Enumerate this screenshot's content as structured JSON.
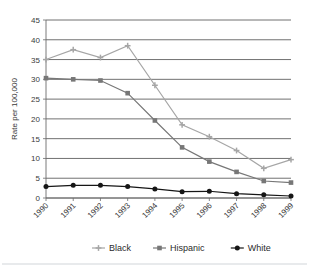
{
  "chart_data": {
    "type": "line",
    "title": "",
    "xlabel": "",
    "ylabel": "Rate per 100,000",
    "categories": [
      "1990",
      "1991",
      "1992",
      "1993",
      "1994",
      "1995",
      "1996",
      "1997",
      "1998",
      "1999"
    ],
    "ylim": [
      0,
      45
    ],
    "yticks": [
      0,
      5,
      10,
      15,
      20,
      25,
      30,
      35,
      40,
      45
    ],
    "grid": "horizontal",
    "legend_position": "bottom",
    "series": [
      {
        "name": "Black",
        "color": "#a6a6a6",
        "marker": "cross",
        "values": [
          35,
          37.5,
          35.5,
          38.5,
          28.5,
          18.5,
          15.5,
          12,
          7.5,
          9.7
        ]
      },
      {
        "name": "Hispanic",
        "color": "#777777",
        "marker": "square",
        "values": [
          30.3,
          30,
          29.7,
          26.5,
          19.6,
          12.8,
          9.2,
          6.6,
          4.3,
          3.9
        ]
      },
      {
        "name": "White",
        "color": "#161616",
        "marker": "circle",
        "values": [
          2.9,
          3.2,
          3.2,
          2.9,
          2.3,
          1.6,
          1.7,
          1.1,
          0.8,
          0.5
        ]
      }
    ]
  },
  "axis": {
    "y_title": "Rate per 100,000",
    "y_tick_labels": [
      "0",
      "5",
      "10",
      "15",
      "20",
      "25",
      "30",
      "35",
      "40",
      "45"
    ],
    "x_tick_labels": [
      "1990",
      "1991",
      "1992",
      "1993",
      "1994",
      "1995",
      "1996",
      "1997",
      "1998",
      "1999"
    ]
  },
  "legend": {
    "items": [
      {
        "label": "Black"
      },
      {
        "label": "Hispanic"
      },
      {
        "label": "White"
      }
    ]
  }
}
